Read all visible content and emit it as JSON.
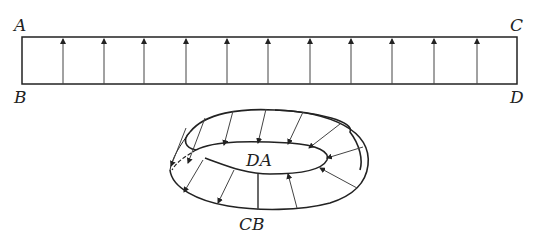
{
  "figure": {
    "strip": {
      "labels": {
        "top_left": "A",
        "top_right": "C",
        "bottom_left": "B",
        "bottom_right": "D"
      },
      "arrow_count": 11,
      "arrow_direction": "up"
    },
    "mobius": {
      "labels": {
        "inner": "DA",
        "bottom": "CB"
      },
      "arrow_count": 12
    },
    "colors": {
      "stroke": "#222222",
      "background": "#ffffff"
    }
  }
}
